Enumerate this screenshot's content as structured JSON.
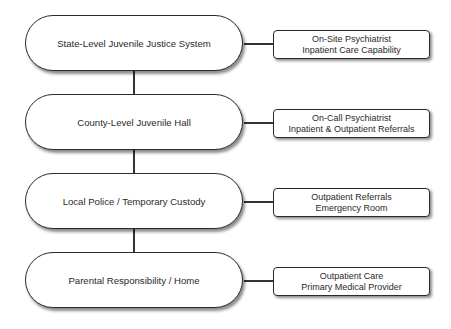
{
  "diagram": {
    "levels": [
      {
        "label": "State-Level Juvenile Justice System",
        "services": [
          "On-Site Psychiatrist",
          "Inpatient Care Capability"
        ]
      },
      {
        "label": "County-Level Juvenile Hall",
        "services": [
          "On-Call Psychiatrist",
          "Inpatient & Outpatient Referrals"
        ]
      },
      {
        "label": "Local Police / Temporary Custody",
        "services": [
          "Outpatient Referrals",
          "Emergency Room"
        ]
      },
      {
        "label": "Parental Responsibility / Home",
        "services": [
          "Outpatient Care",
          "Primary Medical Provider"
        ]
      }
    ],
    "colors": {
      "stroke": "#2b2b2b",
      "fill": "#ffffff",
      "text": "#2a2a2a"
    }
  }
}
